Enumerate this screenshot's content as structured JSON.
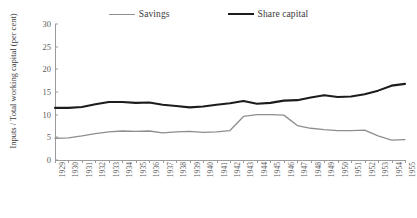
{
  "chart_data": {
    "type": "line",
    "title": "",
    "xlabel": "",
    "ylabel": "Inputs / Total working capital (per cent)",
    "ylim": [
      0,
      30
    ],
    "yticks": [
      0,
      5,
      10,
      15,
      20,
      25,
      30
    ],
    "grid": false,
    "legend_position": "top-center",
    "categories": [
      "1929",
      "1930",
      "1931",
      "1932",
      "1933",
      "1934",
      "1935",
      "1936",
      "1937",
      "1938",
      "1939",
      "1940",
      "1941",
      "1942",
      "1943",
      "1944",
      "1945",
      "1946",
      "1947",
      "1948",
      "1949",
      "1950",
      "1951",
      "1952",
      "1953",
      "1954",
      "1955"
    ],
    "series": [
      {
        "name": "Savings",
        "color": "#8e8e8e",
        "values": [
          4.8,
          4.9,
          5.3,
          5.8,
          6.2,
          6.4,
          6.3,
          6.4,
          6.0,
          6.2,
          6.3,
          6.1,
          6.2,
          6.5,
          9.6,
          10.0,
          10.0,
          9.9,
          7.6,
          7.0,
          6.7,
          6.5,
          6.5,
          6.6,
          5.3,
          4.4,
          4.5
        ]
      },
      {
        "name": "Share capital",
        "color": "#1c1c1c",
        "values": [
          11.5,
          11.5,
          11.7,
          12.3,
          12.8,
          12.8,
          12.6,
          12.7,
          12.2,
          11.9,
          11.6,
          11.8,
          12.2,
          12.5,
          13.0,
          12.4,
          12.6,
          13.1,
          13.2,
          13.8,
          14.3,
          13.9,
          14.0,
          14.5,
          15.3,
          16.4,
          16.8
        ]
      }
    ]
  },
  "legend": {
    "items": [
      {
        "label": "Savings",
        "style": "savings"
      },
      {
        "label": "Share capital",
        "style": "share"
      }
    ]
  }
}
